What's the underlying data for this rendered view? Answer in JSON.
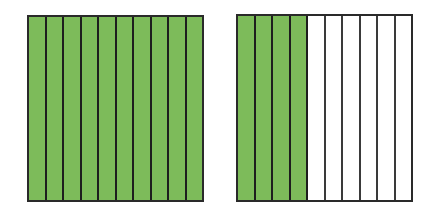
{
  "figures": [
    {
      "id": "left",
      "total_parts": 10,
      "shaded_parts": 10
    },
    {
      "id": "right",
      "total_parts": 10,
      "shaded_parts": 4
    }
  ],
  "colors": {
    "shaded": "#7dbb5a",
    "unshaded": "#ffffff",
    "border": "#2a2a2a"
  }
}
